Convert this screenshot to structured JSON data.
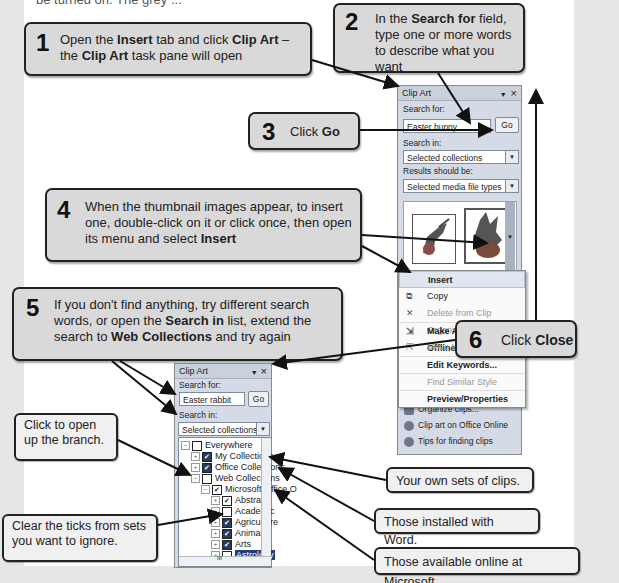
{
  "page": {
    "top_cut_text": "be turned on. The grey ..."
  },
  "steps": [
    {
      "num": "1",
      "html_parts": [
        "Open the ",
        "Insert",
        " tab and click ",
        "Clip Art",
        " – the ",
        "Clip Art",
        " task pane will open"
      ]
    },
    {
      "num": "2",
      "html_parts": [
        "In the ",
        "Search for",
        " field, type one or more words to describe what you want"
      ]
    },
    {
      "num": "3",
      "html_parts": [
        "Click ",
        "Go"
      ]
    },
    {
      "num": "4",
      "html_parts": [
        "When the thumbnail images appear, to insert one, double-click on it or click once, then open its menu and select ",
        "Insert"
      ]
    },
    {
      "num": "5",
      "html_parts": [
        "If you don't find anything, try different search words, or open the ",
        "Search in",
        " list, extend the search to ",
        "Web Collections",
        " and try again"
      ]
    },
    {
      "num": "6",
      "html_parts": [
        "Click ",
        "Close"
      ]
    }
  ],
  "notes": {
    "open_branch": "Click to open up the branch.",
    "clear_ticks": "Clear the ticks from sets you want to ignore.",
    "own_sets": "Your own sets of clips.",
    "installed": "Those installed with Word.",
    "online": "Those available online at Microsoft."
  },
  "pane1": {
    "title": "Clip Art",
    "dropdown_icon": "▼",
    "close_icon": "×",
    "search_for_label": "Search for:",
    "search_value": "Easter bunny",
    "go_label": "Go",
    "search_in_label": "Search in:",
    "search_in_value": "Selected collections",
    "results_label": "Results should be:",
    "results_value": "Selected media file types",
    "menu": [
      {
        "label": "Insert",
        "icon": "",
        "state": "highlighted"
      },
      {
        "label": "Copy",
        "icon": "copy-icon",
        "state": "normal"
      },
      {
        "label": "Delete from Clip Organizer",
        "icon": "delete-icon",
        "state": "disabled"
      },
      {
        "label": "Make Available Offline...",
        "icon": "offline-icon",
        "state": "bold"
      },
      {
        "label": "Move to Collection...",
        "icon": "move-icon",
        "state": "disabled"
      },
      {
        "label": "Edit Keywords...",
        "icon": "",
        "state": "bold"
      },
      {
        "label": "Find Similar Style",
        "icon": "",
        "state": "disabled"
      },
      {
        "label": "Preview/Properties",
        "icon": "",
        "state": "bold"
      }
    ],
    "footer": [
      {
        "label": "Organize clips...",
        "icon": "organize-icon"
      },
      {
        "label": "Clip art on Office Online",
        "icon": "globe-icon"
      },
      {
        "label": "Tips for finding clips",
        "icon": "help-icon"
      }
    ]
  },
  "pane2": {
    "title": "Clip Art",
    "dropdown_icon": "▼",
    "close_icon": "×",
    "search_for_label": "Search for:",
    "search_value": "Easter rabbit",
    "go_label": "Go",
    "search_in_label": "Search in:",
    "search_in_value": "Selected collections",
    "tree": [
      {
        "label": "Everywhere",
        "level": 0,
        "expander": "−",
        "check": "off"
      },
      {
        "label": "My Collections",
        "level": 1,
        "expander": "+",
        "check": "multi"
      },
      {
        "label": "Office Collections",
        "level": 1,
        "expander": "+",
        "check": "multi"
      },
      {
        "label": "Web Collections",
        "level": 1,
        "expander": "−",
        "check": "off"
      },
      {
        "label": "Microsoft Office O",
        "level": 2,
        "expander": "−",
        "check": "on"
      },
      {
        "label": "Abstract",
        "level": 3,
        "expander": "+",
        "check": "on"
      },
      {
        "label": "Academic",
        "level": 3,
        "expander": "+",
        "check": "off"
      },
      {
        "label": "Agriculture",
        "level": 3,
        "expander": "+",
        "check": "multi"
      },
      {
        "label": "Animals",
        "level": 3,
        "expander": "+",
        "check": "multi"
      },
      {
        "label": "Arts",
        "level": 3,
        "expander": "+",
        "check": "multi"
      },
      {
        "label": "Astrology",
        "level": 3,
        "expander": "+",
        "check": "off",
        "selected": true
      }
    ],
    "hscroll_grip": "III"
  },
  "colors": {
    "callout_bg": "#d9d9d9",
    "note_bg": "#f0f0f0",
    "page_bg": "#ffffff",
    "margin_bg": "#e6e6e6",
    "pane_bg": "#d4dbe6"
  }
}
